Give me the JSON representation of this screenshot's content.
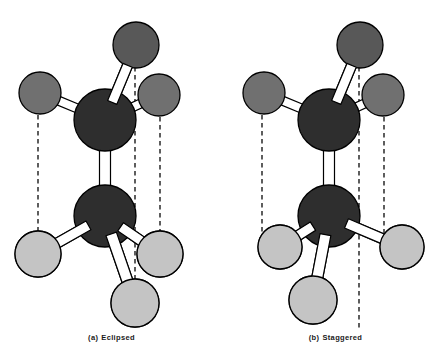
{
  "figure": {
    "width": 447,
    "height": 353,
    "background": "#ffffff"
  },
  "colors": {
    "carbon_fill": "#2e2e2e",
    "hydrogen_back_fill": "#585858",
    "hydrogen_mid_fill": "#707070",
    "hydrogen_front_fill": "#c4c4c4",
    "outline": "#000000",
    "bond_fill": "#ffffff",
    "dashed_line": "#1a1a1a",
    "caption_text": "#1a1a1a"
  },
  "panels": [
    {
      "id": "eclipsed",
      "caption_label": "(a)",
      "caption_text": "Eclipsed",
      "atoms": [
        {
          "name": "carbon-upper",
          "element": "C",
          "cx": 105,
          "cy": 120,
          "r": 31,
          "shade": "carbon_fill"
        },
        {
          "name": "carbon-lower",
          "element": "C",
          "cx": 105,
          "cy": 216,
          "r": 31,
          "shade": "carbon_fill"
        },
        {
          "name": "hydrogen-upper-back",
          "element": "H",
          "cx": 136,
          "cy": 45,
          "r": 23,
          "shade": "hydrogen_back_fill"
        },
        {
          "name": "hydrogen-upper-left",
          "element": "H",
          "cx": 40,
          "cy": 93,
          "r": 21,
          "shade": "hydrogen_mid_fill"
        },
        {
          "name": "hydrogen-upper-right",
          "element": "H",
          "cx": 159,
          "cy": 95,
          "r": 21,
          "shade": "hydrogen_mid_fill"
        },
        {
          "name": "hydrogen-lower-left",
          "element": "H",
          "cx": 38,
          "cy": 254,
          "r": 23,
          "shade": "hydrogen_front_fill"
        },
        {
          "name": "hydrogen-lower-right",
          "element": "H",
          "cx": 160,
          "cy": 254,
          "r": 23,
          "shade": "hydrogen_front_fill"
        },
        {
          "name": "hydrogen-lower-front",
          "element": "H",
          "cx": 135,
          "cy": 303,
          "r": 24,
          "shade": "hydrogen_front_fill"
        }
      ],
      "bonds": [
        {
          "name": "bond-c-c",
          "from": "carbon-upper",
          "to": "carbon-lower",
          "width": 11
        },
        {
          "name": "bond-cupper-h-back",
          "from": "carbon-upper",
          "to": "hydrogen-upper-back",
          "width": 10
        },
        {
          "name": "bond-cupper-h-left",
          "from": "carbon-upper",
          "to": "hydrogen-upper-left",
          "width": 9
        },
        {
          "name": "bond-cupper-h-right",
          "from": "carbon-upper",
          "to": "hydrogen-upper-right",
          "width": 9
        },
        {
          "name": "bond-clower-h-left",
          "from": "carbon-lower",
          "to": "hydrogen-lower-left",
          "width": 10
        },
        {
          "name": "bond-clower-h-right",
          "from": "carbon-lower",
          "to": "hydrogen-lower-right",
          "width": 10
        },
        {
          "name": "bond-clower-h-front",
          "from": "carbon-lower",
          "to": "hydrogen-lower-front",
          "width": 11
        }
      ],
      "dashed_lines": [
        {
          "name": "dashed-line-left",
          "x": 38,
          "y1": 115,
          "y2": 233
        },
        {
          "name": "dashed-line-center",
          "x": 135,
          "y1": 67,
          "y2": 280
        },
        {
          "name": "dashed-line-right",
          "x": 160,
          "y1": 117,
          "y2": 233
        }
      ]
    },
    {
      "id": "staggered",
      "caption_label": "(b)",
      "caption_text": "Staggered",
      "atoms": [
        {
          "name": "carbon-upper",
          "element": "C",
          "cx": 105,
          "cy": 120,
          "r": 31,
          "shade": "carbon_fill"
        },
        {
          "name": "carbon-lower",
          "element": "C",
          "cx": 105,
          "cy": 216,
          "r": 31,
          "shade": "carbon_fill"
        },
        {
          "name": "hydrogen-upper-back",
          "element": "H",
          "cx": 136,
          "cy": 45,
          "r": 23,
          "shade": "hydrogen_back_fill"
        },
        {
          "name": "hydrogen-upper-left",
          "element": "H",
          "cx": 40,
          "cy": 93,
          "r": 21,
          "shade": "hydrogen_mid_fill"
        },
        {
          "name": "hydrogen-upper-right",
          "element": "H",
          "cx": 159,
          "cy": 95,
          "r": 21,
          "shade": "hydrogen_mid_fill"
        },
        {
          "name": "hydrogen-lower-left",
          "element": "H",
          "cx": 56,
          "cy": 247,
          "r": 22,
          "shade": "hydrogen_front_fill"
        },
        {
          "name": "hydrogen-lower-right",
          "element": "H",
          "cx": 178,
          "cy": 247,
          "r": 22,
          "shade": "hydrogen_front_fill"
        },
        {
          "name": "hydrogen-lower-front",
          "element": "H",
          "cx": 89,
          "cy": 300,
          "r": 24,
          "shade": "hydrogen_front_fill"
        }
      ],
      "bonds": [
        {
          "name": "bond-c-c",
          "from": "carbon-upper",
          "to": "carbon-lower",
          "width": 11
        },
        {
          "name": "bond-cupper-h-back",
          "from": "carbon-upper",
          "to": "hydrogen-upper-back",
          "width": 10
        },
        {
          "name": "bond-cupper-h-left",
          "from": "carbon-upper",
          "to": "hydrogen-upper-left",
          "width": 9
        },
        {
          "name": "bond-cupper-h-right",
          "from": "carbon-upper",
          "to": "hydrogen-upper-right",
          "width": 9
        },
        {
          "name": "bond-clower-h-left",
          "from": "carbon-lower",
          "to": "hydrogen-lower-left",
          "width": 10
        },
        {
          "name": "bond-clower-h-right",
          "from": "carbon-lower",
          "to": "hydrogen-lower-right",
          "width": 10
        },
        {
          "name": "bond-clower-h-front",
          "from": "carbon-lower",
          "to": "hydrogen-lower-front",
          "width": 11
        }
      ],
      "dashed_lines": [
        {
          "name": "dashed-line-left",
          "x": 38,
          "y1": 115,
          "y2": 250
        },
        {
          "name": "dashed-line-center",
          "x": 135,
          "y1": 67,
          "y2": 330
        },
        {
          "name": "dashed-line-right",
          "x": 160,
          "y1": 117,
          "y2": 250
        }
      ]
    }
  ]
}
